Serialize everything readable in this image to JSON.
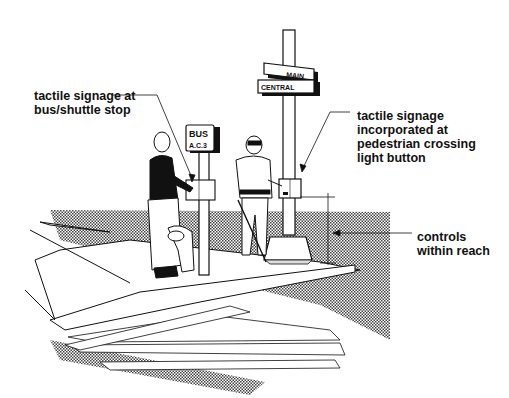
{
  "figure": {
    "callouts": [
      {
        "id": "bus-stop-signage",
        "lines": [
          "tactile signage at",
          "bus/shuttle stop"
        ]
      },
      {
        "id": "crossing-signage",
        "lines": [
          "tactile signage",
          "incorporated at",
          "pedestrian crossing",
          "light button"
        ]
      },
      {
        "id": "controls-reach",
        "lines": [
          "controls",
          "within reach"
        ]
      }
    ],
    "signs": {
      "bus_sign_top": "BUS",
      "bus_sign_bottom": "A.C.3",
      "street_sign_upper": "MAIN",
      "street_sign_upper_suffix": "ST",
      "street_sign_lower": "CENTRAL",
      "street_sign_lower_suffix": "ST"
    },
    "figures": [
      "woman-with-guide-dog",
      "man-with-cane"
    ],
    "colors": {
      "ink": "#111111",
      "paper": "#ffffff",
      "stipple": "#8a8a8a"
    }
  }
}
